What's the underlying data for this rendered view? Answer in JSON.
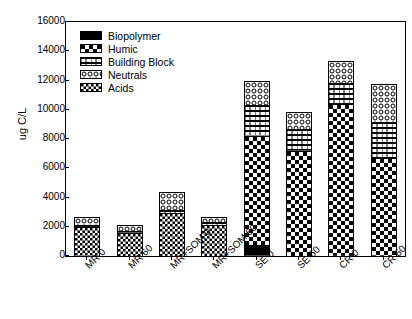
{
  "chart_data": {
    "type": "bar",
    "subtype": "stacked",
    "title": "",
    "xlabel": "",
    "ylabel": "ug C/L",
    "ylim": [
      0,
      16000
    ],
    "ytick_labels": [
      "0",
      "2000",
      "4000",
      "6000",
      "8000",
      "10000",
      "12000",
      "14000",
      "16000"
    ],
    "ytick_values": [
      0,
      2000,
      4000,
      6000,
      8000,
      10000,
      12000,
      14000,
      16000
    ],
    "grid": false,
    "legend_position": "upper-left-inside",
    "categories": [
      "MR 0",
      "MR 60",
      "MR+SOM 0",
      "MR+SOM 60",
      "SE 0",
      "SE 60",
      "CR 0",
      "CR 60"
    ],
    "series": [
      {
        "name": "Biopolymer",
        "pattern": "solid-black",
        "color": "#000000",
        "values": [
          0,
          0,
          0,
          0,
          800,
          0,
          0,
          0
        ]
      },
      {
        "name": "Humic",
        "pattern": "large-checker",
        "color": "#ffffff",
        "values": [
          0,
          0,
          0,
          0,
          7550,
          7250,
          10450,
          6750
        ]
      },
      {
        "name": "Building Block",
        "pattern": "brick",
        "color": "#ffffff",
        "values": [
          200,
          180,
          300,
          250,
          2150,
          1550,
          1500,
          2550
        ]
      },
      {
        "name": "Neutrals",
        "pattern": "small-circles",
        "color": "#ffffff",
        "values": [
          650,
          500,
          1300,
          450,
          1750,
          1250,
          1600,
          2700
        ]
      },
      {
        "name": "Acids",
        "pattern": "fine-checker",
        "color": "#ffffff",
        "values": [
          2050,
          1670,
          3000,
          2200,
          0,
          0,
          0,
          0
        ]
      }
    ],
    "totals": [
      2900,
      2350,
      4600,
      2900,
      12250,
      10050,
      13550,
      12000
    ],
    "stack_order_bottom_to_top": [
      "Biopolymer",
      "Acids",
      "Humic",
      "Building Block",
      "Neutrals"
    ]
  },
  "legend": {
    "items": [
      {
        "label": "Biopolymer"
      },
      {
        "label": "Humic"
      },
      {
        "label": "Building Block"
      },
      {
        "label": "Neutrals"
      },
      {
        "label": "Acids"
      }
    ]
  }
}
